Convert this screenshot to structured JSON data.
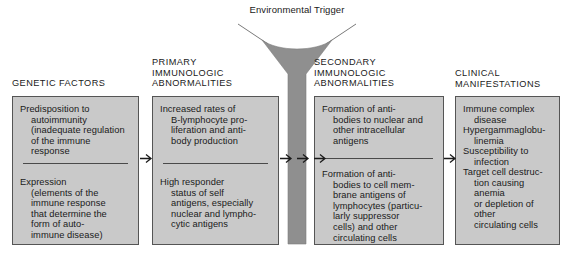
{
  "diagram": {
    "title_label": "Environmental\nTrigger",
    "funnel": {
      "name": "environmental-trigger-funnel",
      "fill_color": "#8f8f8f",
      "outline_color": "#6e6e6e"
    },
    "panel_fill": "#c9c9c9",
    "panel_border": "#555555",
    "columns": [
      {
        "id": "genetic-factors",
        "header": "GENETIC FACTORS",
        "blocks": [
          {
            "lead": "Predisposition to",
            "rest": "autoimmunity\n(inadequate regulation\nof the immune\nresponse"
          },
          {
            "lead": "Expression",
            "rest": "(elements of the\nimmune response\nthat determine the\nform of auto-\nimmune disease)"
          }
        ],
        "divider": true
      },
      {
        "id": "primary-immunologic-abnormalities",
        "header": "PRIMARY\nIMMUNOLOGIC\nABNORMALITIES",
        "blocks": [
          {
            "lead": "Increased rates of",
            "rest": "B-lymphocyte pro-\nliferation and anti-\nbody production"
          },
          {
            "lead": "High responder",
            "rest": "status of self\nantigens, especially\nnuclear and lympho-\ncytic antigens"
          }
        ],
        "divider": true
      },
      {
        "id": "secondary-immunologic-abnormalities",
        "header": "SECONDARY\nIMMUNOLOGIC\nABNORMALITIES",
        "blocks": [
          {
            "lead": "Formation of anti-",
            "rest": "bodies to nuclear and\nother intracellular\nantigens"
          },
          {
            "lead": "Formation of anti-",
            "rest": "bodies to cell mem-\nbrane antigens of\nlymphocytes (particu-\nlarly suppressor\ncells) and other\ncirculating cells"
          }
        ],
        "divider": true
      },
      {
        "id": "clinical-manifestations",
        "header": "CLINICAL\nMANIFESTATIONS",
        "blocks": [
          {
            "lead": "Immune complex",
            "rest": "disease"
          },
          {
            "lead": "Hypergammaglobu-",
            "rest": "linemia"
          },
          {
            "lead": "Susceptibility to",
            "rest": "infection"
          },
          {
            "lead": "Target cell destruc-",
            "rest": "tion causing anemia\nor depletion of other\ncirculating cells"
          }
        ],
        "divider": false
      }
    ],
    "arrows": [
      {
        "name": "arrow-genetic-to-primary"
      },
      {
        "name": "arrow-primary-to-funnel"
      },
      {
        "name": "arrow-through-funnel"
      },
      {
        "name": "arrow-funnel-to-secondary"
      },
      {
        "name": "arrow-secondary-to-clinical"
      }
    ]
  }
}
